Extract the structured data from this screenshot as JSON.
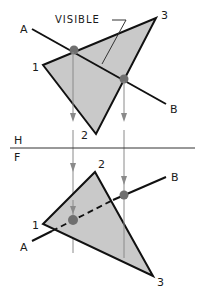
{
  "diagram": {
    "colors": {
      "plane_fill": "#c9c9c9",
      "edge": "#111111",
      "projector": "#8a8a8a",
      "point": "#6f6f6f",
      "background": "#ffffff"
    },
    "fold_line": {
      "upper_label": "H",
      "lower_label": "F"
    },
    "top_view": {
      "label_text": "VISIBLE",
      "vertices": [
        {
          "label": "1",
          "x": 43,
          "y": 65
        },
        {
          "label": "2",
          "x": 96,
          "y": 134
        },
        {
          "label": "3",
          "x": 156,
          "y": 18
        }
      ],
      "line": {
        "start_label": "A",
        "end_label": "B"
      }
    },
    "front_view": {
      "vertices": [
        {
          "label": "1",
          "x": 43,
          "y": 224
        },
        {
          "label": "2",
          "x": 95,
          "y": 172
        },
        {
          "label": "3",
          "x": 153,
          "y": 276
        }
      ],
      "line": {
        "start_label": "A",
        "end_label": "B"
      }
    }
  }
}
